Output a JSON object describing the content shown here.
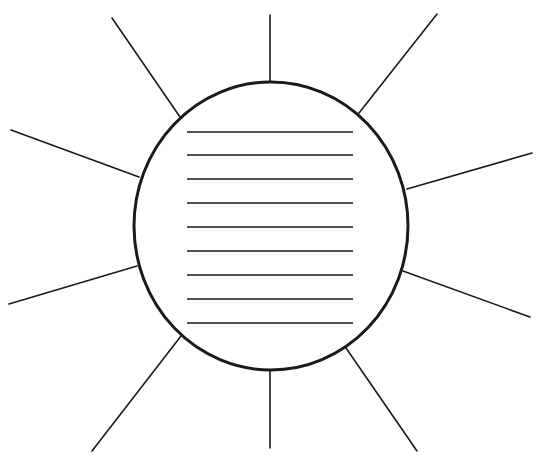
{
  "diagram": {
    "type": "sun-organizer",
    "canvas": {
      "width": 543,
      "height": 459,
      "background": "#ffffff"
    },
    "stroke_color": "#1a1a1a",
    "circle": {
      "cx": 271,
      "cy": 226,
      "rx": 137,
      "ry": 144,
      "stroke_width": 3
    },
    "writing_lines": {
      "count": 9,
      "x1": 187,
      "x2": 353,
      "y": [
        132,
        155,
        179,
        203,
        227,
        251,
        275,
        299,
        323
      ],
      "stroke_width": 1.6
    },
    "rays": [
      {
        "name": "ray-top",
        "x1": 270,
        "y1": 15,
        "x2": 270,
        "y2": 82
      },
      {
        "name": "ray-top-right",
        "x1": 437,
        "y1": 14,
        "x2": 359,
        "y2": 113
      },
      {
        "name": "ray-right-upper",
        "x1": 532,
        "y1": 153,
        "x2": 407,
        "y2": 189
      },
      {
        "name": "ray-right-lower",
        "x1": 530,
        "y1": 317,
        "x2": 403,
        "y2": 271
      },
      {
        "name": "ray-bottom-right",
        "x1": 417,
        "y1": 451,
        "x2": 346,
        "y2": 348
      },
      {
        "name": "ray-bottom",
        "x1": 270,
        "y1": 448,
        "x2": 270,
        "y2": 371
      },
      {
        "name": "ray-bottom-left",
        "x1": 92,
        "y1": 451,
        "x2": 181,
        "y2": 336
      },
      {
        "name": "ray-left-lower",
        "x1": 9,
        "y1": 304,
        "x2": 137,
        "y2": 266
      },
      {
        "name": "ray-left-upper",
        "x1": 11,
        "y1": 130,
        "x2": 139,
        "y2": 177
      },
      {
        "name": "ray-top-left",
        "x1": 112,
        "y1": 18,
        "x2": 180,
        "y2": 117
      }
    ],
    "ray_stroke_width": 1.6,
    "top_text_fragment": "\""
  }
}
